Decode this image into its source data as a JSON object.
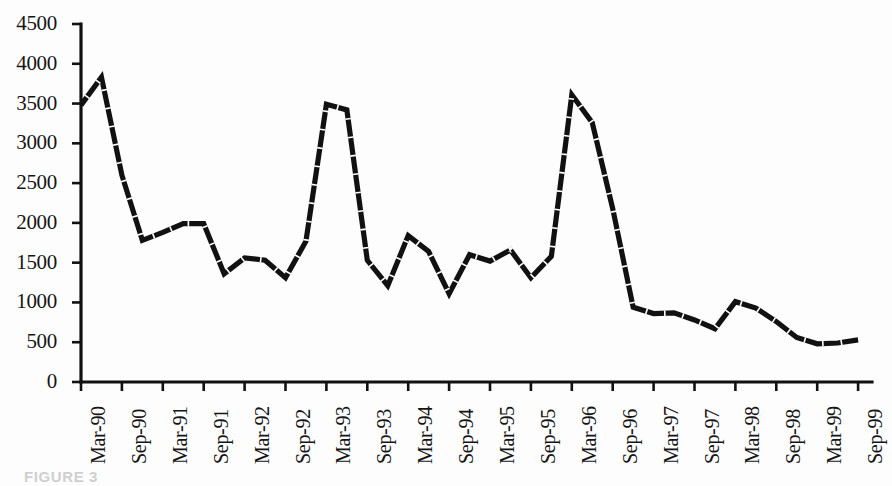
{
  "figure": {
    "caption": "FIGURE 3",
    "background_color": "#fdfdfd",
    "line_color": "#111111",
    "axis_color": "#111111"
  },
  "chart_data": {
    "type": "line",
    "title": "",
    "subtitle": "",
    "xlabel": "",
    "ylabel": "",
    "ylim": [
      0,
      4500
    ],
    "y_ticks": [
      0,
      500,
      1000,
      1500,
      2000,
      2500,
      3000,
      3500,
      4000,
      4500
    ],
    "y_tick_labels": [
      "0",
      "500",
      "1000",
      "1500",
      "2000",
      "2500",
      "3000",
      "3500",
      "4000",
      "4500"
    ],
    "grid": false,
    "legend": null,
    "legend_position": "none",
    "x_tick_labels": [
      "Mar-90",
      "Sep-90",
      "Mar-91",
      "Sep-91",
      "Mar-92",
      "Sep-92",
      "Mar-93",
      "Sep-93",
      "Mar-94",
      "Sep-94",
      "Mar-95",
      "Sep-95",
      "Mar-96",
      "Sep-96",
      "Mar-97",
      "Sep-97",
      "Mar-98",
      "Sep-98",
      "Mar-99",
      "Sep-99"
    ],
    "x_tick_interval": "semi-annual",
    "data_interval": "quarterly",
    "x": [
      "Mar-90",
      "Jun-90",
      "Sep-90",
      "Dec-90",
      "Mar-91",
      "Jun-91",
      "Sep-91",
      "Dec-91",
      "Mar-92",
      "Jun-92",
      "Sep-92",
      "Dec-92",
      "Mar-93",
      "Jun-93",
      "Sep-93",
      "Dec-93",
      "Mar-94",
      "Jun-94",
      "Sep-94",
      "Dec-94",
      "Mar-95",
      "Jun-95",
      "Sep-95",
      "Dec-95",
      "Mar-96",
      "Jun-96",
      "Sep-96",
      "Dec-96",
      "Mar-97",
      "Jun-97",
      "Sep-97",
      "Dec-97",
      "Mar-98",
      "Jun-98",
      "Sep-98",
      "Dec-98",
      "Mar-99",
      "Jun-99",
      "Sep-99"
    ],
    "values": [
      3480,
      3830,
      2600,
      1780,
      1880,
      1990,
      1990,
      1360,
      1560,
      1530,
      1310,
      1770,
      3490,
      3420,
      1530,
      1210,
      1840,
      1640,
      1110,
      1600,
      1520,
      1660,
      1310,
      1580,
      3610,
      3260,
      2180,
      940,
      860,
      870,
      780,
      670,
      1010,
      930,
      760,
      560,
      480,
      490,
      530
    ],
    "series": [
      {
        "name": "series-1",
        "values": [
          3480,
          3830,
          2600,
          1780,
          1880,
          1990,
          1990,
          1360,
          1560,
          1530,
          1310,
          1770,
          3490,
          3420,
          1530,
          1210,
          1840,
          1640,
          1110,
          1600,
          1520,
          1660,
          1310,
          1580,
          3610,
          3260,
          2180,
          940,
          860,
          870,
          780,
          670,
          1010,
          930,
          760,
          560,
          480,
          490,
          530
        ]
      }
    ]
  }
}
